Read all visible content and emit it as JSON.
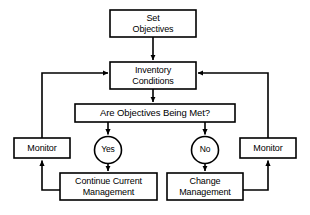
{
  "diagram": {
    "background_color": "#ffffff",
    "line_color": "#000000",
    "text_color": "#000000",
    "nodes": {
      "set_objectives": {
        "label": "Set\nObjectives",
        "shape": "rectangle"
      },
      "inventory_conditions": {
        "label": "Inventory\nConditions",
        "shape": "rectangle"
      },
      "are_objectives_being_met": {
        "label": "Are Objectives Being Met?",
        "shape": "rectangle"
      },
      "yes": {
        "label": "Yes",
        "shape": "circle"
      },
      "no": {
        "label": "No",
        "shape": "circle"
      },
      "monitor_left": {
        "label": "Monitor",
        "shape": "rectangle"
      },
      "monitor_right": {
        "label": "Monitor",
        "shape": "rectangle"
      },
      "continue_current_management": {
        "label": "Continue Current\nManagement",
        "shape": "rectangle"
      },
      "change_management": {
        "label": "Change\nManagement",
        "shape": "rectangle"
      }
    }
  }
}
